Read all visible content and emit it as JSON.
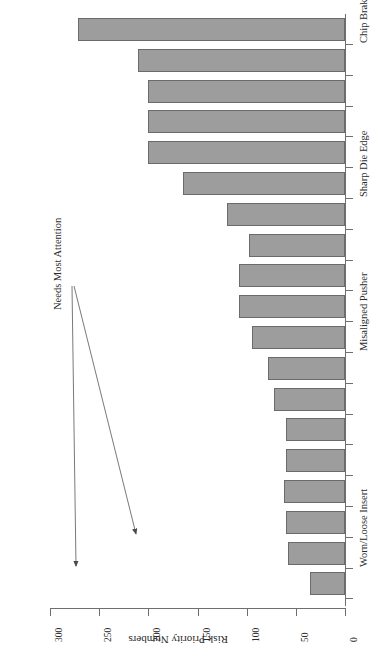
{
  "chart_data": {
    "type": "bar",
    "orientation": "horizontal-rotated",
    "title": "",
    "xlabel": "",
    "ylabel": "Risk Priority Numbers",
    "ylim": [
      0,
      300
    ],
    "grid": false,
    "legend": null,
    "value_axis_label": "Risk Priority Numbers",
    "value_ticks": [
      "0",
      "50",
      "100",
      "150",
      "200",
      "250",
      "300"
    ],
    "value_tick_numbers": [
      0,
      50,
      100,
      150,
      200,
      250,
      300
    ],
    "categories": [
      "Chip Braker Angle Ground Incorrectly",
      "",
      "",
      "",
      "",
      "Sharp Die Edge",
      "",
      "",
      "",
      "",
      "Misaligned Pusher",
      "",
      "",
      "",
      "",
      "",
      "",
      "Worn/Loose Insert",
      ""
    ],
    "visible_category_labels": [
      "Chip Braker Angle Ground Incorrectly",
      "Sharp Die Edge",
      "Misaligned Pusher",
      "Worn/Loose Insert"
    ],
    "values": [
      272,
      211,
      200,
      200,
      200,
      165,
      120,
      98,
      108,
      108,
      95,
      78,
      72,
      60,
      60,
      62,
      60,
      58,
      36
    ],
    "bar_color": "#9d9d9d",
    "bar_border_color": "#6b6b6b",
    "annotations": [
      {
        "text": "Needs Most Attention",
        "points_to": [
          "bar-1",
          "bar-2"
        ]
      }
    ]
  },
  "annotation": {
    "label": "Needs Most Attention"
  },
  "axis": {
    "value_title": "Risk Priority Numbers"
  }
}
